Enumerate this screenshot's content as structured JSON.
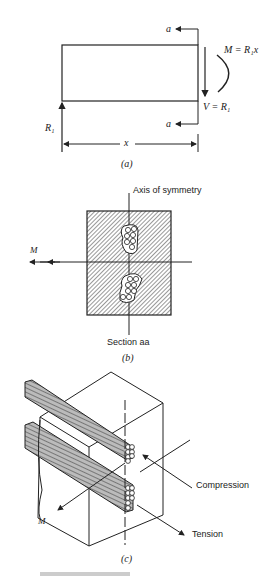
{
  "panel_a": {
    "section_top": "a",
    "section_bottom": "a",
    "moment_label": "M = R₁x",
    "shear_label": "V = R₁",
    "reaction_label": "R₁",
    "length_label": "x",
    "caption": "(a)"
  },
  "panel_b": {
    "axis_label": "Axis of symmetry",
    "moment_label": "M",
    "section_label": "Section aa",
    "caption": "(b)"
  },
  "panel_c": {
    "compression_label": "Compression",
    "tension_label": "Tension",
    "moment_label": "M",
    "caption": "(c)"
  },
  "figure_caption": "Fig. 5.5.3"
}
